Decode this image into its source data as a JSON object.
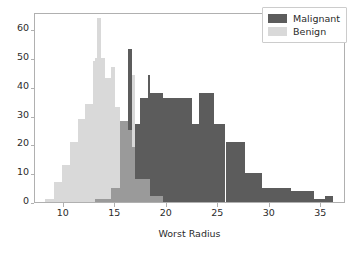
{
  "chart_data": {
    "type": "bar",
    "subtype": "histogram",
    "title": "",
    "xlabel": "Worst Radius",
    "ylabel": "",
    "xlim": [
      7.2,
      37.4
    ],
    "ylim": [
      0,
      66
    ],
    "xticks": [
      10,
      15,
      20,
      25,
      30,
      35
    ],
    "yticks": [
      0,
      10,
      20,
      30,
      40,
      50,
      60
    ],
    "grid": false,
    "legend_position": "upper right",
    "overlap_mode": "alpha-blend",
    "colors": {
      "malignant": "#5c5c5c",
      "benign": "#d9d9d9",
      "overlap": "#9a9a9a",
      "frame": "#b0b0b0",
      "text": "#2b2b2b",
      "background": "#ffffff"
    },
    "series": [
      {
        "name": "Malignant",
        "color": "#5c5c5c",
        "bins": [
          {
            "x0": 13.0,
            "x1": 14.6,
            "count": 1
          },
          {
            "x0": 14.6,
            "x1": 15.5,
            "count": 5
          },
          {
            "x0": 15.5,
            "x1": 16.6,
            "count": 28
          },
          {
            "x0": 16.6,
            "x1": 17.4,
            "count": 19
          },
          {
            "x0": 17.4,
            "x1": 18.2,
            "count": 28
          },
          {
            "x0": 18.2,
            "x1": 19.9,
            "count": 36
          },
          {
            "x0": 19.9,
            "x1": 22.4,
            "count": 36
          },
          {
            "x0": 22.4,
            "x1": 23.1,
            "count": 27
          },
          {
            "x0": 23.1,
            "x1": 24.6,
            "count": 38
          },
          {
            "x0": 24.6,
            "x1": 25.7,
            "count": 27
          },
          {
            "x0": 25.7,
            "x1": 27.6,
            "count": 21
          },
          {
            "x0": 27.6,
            "x1": 29.2,
            "count": 10
          },
          {
            "x0": 29.2,
            "x1": 32.1,
            "count": 5
          },
          {
            "x0": 32.1,
            "x1": 34.3,
            "count": 4
          },
          {
            "x0": 34.3,
            "x1": 35.4,
            "count": 1
          },
          {
            "x0": 35.4,
            "x1": 36.1,
            "count": 2
          }
        ]
      },
      {
        "name": "Benign",
        "color": "#d9d9d9",
        "bins": [
          {
            "x0": 8.2,
            "x1": 9.0,
            "count": 1
          },
          {
            "x0": 9.0,
            "x1": 9.8,
            "count": 7
          },
          {
            "x0": 9.8,
            "x1": 10.6,
            "count": 13
          },
          {
            "x0": 10.6,
            "x1": 11.4,
            "count": 21
          },
          {
            "x0": 11.4,
            "x1": 12.1,
            "count": 29
          },
          {
            "x0": 12.1,
            "x1": 12.8,
            "count": 34
          },
          {
            "x0": 12.8,
            "x1": 13.2,
            "count": 49
          },
          {
            "x0": 13.2,
            "x1": 13.6,
            "count": 63
          },
          {
            "x0": 13.6,
            "x1": 14.0,
            "count": 49
          },
          {
            "x0": 14.0,
            "x1": 15.0,
            "count": 42
          },
          {
            "x0": 15.0,
            "x1": 16.2,
            "count": 28
          },
          {
            "x0": 16.2,
            "x1": 16.9,
            "count": 25
          },
          {
            "x0": 16.9,
            "x1": 18.4,
            "count": 8
          },
          {
            "x0": 18.4,
            "x1": 19.6,
            "count": 2
          }
        ]
      }
    ]
  },
  "legend": {
    "entries": [
      {
        "label": "Malignant",
        "swatch": "malig"
      },
      {
        "label": "Benign",
        "swatch": "benign"
      }
    ]
  },
  "axes": {
    "x_label": "Worst Radius",
    "x_tick_labels": [
      "10",
      "15",
      "20",
      "25",
      "30",
      "35"
    ],
    "y_tick_labels": [
      "0",
      "10",
      "20",
      "30",
      "40",
      "50",
      "60"
    ]
  }
}
